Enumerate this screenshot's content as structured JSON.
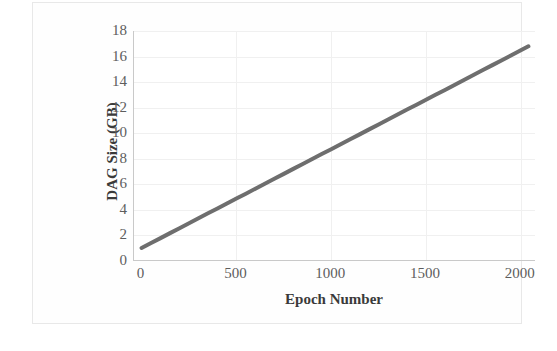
{
  "chart_data": {
    "type": "line",
    "title": "",
    "subtitle": "",
    "xlabel": "Epoch Number",
    "ylabel": "DAG Size (GB)",
    "xlim": [
      -40,
      2080
    ],
    "ylim": [
      0,
      18
    ],
    "grid": true,
    "legend_position": "none",
    "annotations": [],
    "x_ticks": [
      0,
      500,
      1000,
      1500,
      2000
    ],
    "x_tick_labels": [
      "0",
      "500",
      "1000",
      "1500",
      "2000"
    ],
    "y_ticks": [
      0,
      2,
      4,
      6,
      8,
      10,
      12,
      14,
      16,
      18
    ],
    "y_tick_labels": [
      "0",
      "2",
      "4",
      "6",
      "8",
      "10",
      "12",
      "14",
      "16",
      "18"
    ],
    "series": [
      {
        "name": "DAG Size",
        "color": "#6e6e6e",
        "line_width": 4,
        "x": [
          0,
          50,
          100,
          150,
          200,
          250,
          300,
          350,
          400,
          450,
          500,
          550,
          600,
          650,
          700,
          750,
          800,
          850,
          900,
          950,
          1000,
          1050,
          1100,
          1150,
          1200,
          1250,
          1300,
          1350,
          1400,
          1450,
          1500,
          1550,
          1600,
          1650,
          1700,
          1750,
          1800,
          1850,
          1900,
          1950,
          2000,
          2040
        ],
        "values": [
          1.02,
          1.41,
          1.79,
          2.18,
          2.57,
          2.95,
          3.34,
          3.73,
          4.11,
          4.5,
          4.89,
          5.27,
          5.66,
          6.05,
          6.43,
          6.82,
          7.21,
          7.59,
          7.98,
          8.37,
          8.75,
          9.14,
          9.53,
          9.91,
          10.3,
          10.69,
          11.07,
          11.46,
          11.85,
          12.23,
          12.62,
          13.01,
          13.39,
          13.78,
          14.17,
          14.55,
          14.94,
          15.33,
          15.71,
          16.1,
          16.49,
          16.8
        ]
      }
    ]
  },
  "chart": {
    "x_axis_title": "Epoch Number",
    "y_axis_title": "DAG Size (GB)",
    "x_tick_labels": [
      "0",
      "500",
      "1000",
      "1500",
      "2000"
    ],
    "y_tick_labels": [
      "0",
      "2",
      "4",
      "6",
      "8",
      "10",
      "12",
      "14",
      "16",
      "18"
    ],
    "series_color": "#6e6e6e",
    "grid_color": "#f0f0f0",
    "axis_color": "#c9c9c9",
    "text_color": "#5d5d5d"
  }
}
